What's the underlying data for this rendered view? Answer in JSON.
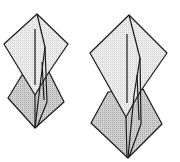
{
  "diagram": {
    "type": "origami-fold-steps",
    "steps": [
      {
        "name": "step-a",
        "description": "Folded model, narrower view"
      },
      {
        "name": "step-b",
        "description": "Folded model, wider view"
      }
    ],
    "colors": {
      "background": "#ffffff",
      "front_face": "#e6e6e6",
      "back_face": "#c4c4c4",
      "stroke": "#1a1a1a"
    }
  }
}
